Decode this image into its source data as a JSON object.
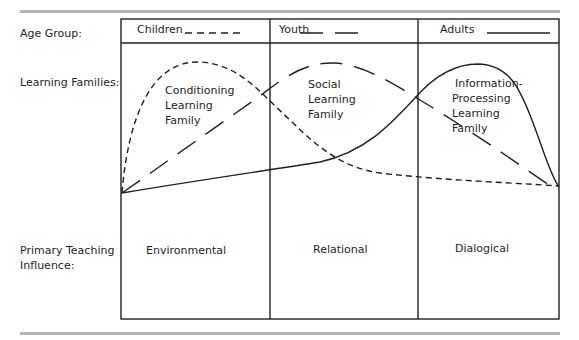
{
  "figure": {
    "title_fragment": "g    y                  g",
    "row_labels": {
      "age_group": "Age Group:",
      "learning_families": "Learning Families:",
      "primary_teaching_influence_line1": "Primary Teaching",
      "primary_teaching_influence_line2": "Influence:"
    },
    "columns": [
      {
        "age_group": "Children",
        "line_style": "short-dash",
        "family_lines": [
          "Conditioning",
          "Learning",
          "Family"
        ],
        "influence": "Environmental"
      },
      {
        "age_group": "Youth",
        "line_style": "long-dash",
        "family_lines": [
          "Social",
          "Learning",
          "Family"
        ],
        "influence": "Relational"
      },
      {
        "age_group": "Adults",
        "line_style": "solid",
        "family_lines": [
          "Information-",
          "Processing",
          "Learning",
          "Family"
        ],
        "influence": "Dialogical"
      }
    ],
    "colors": {
      "ink": "#231f20",
      "rule": "#b3b3b3",
      "background": "#ffffff"
    }
  }
}
